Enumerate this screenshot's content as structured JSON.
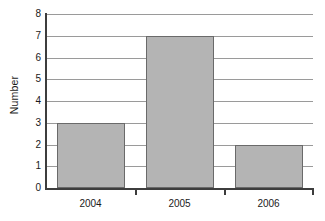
{
  "chart_data": {
    "type": "bar",
    "title": "",
    "subtitle": "",
    "xlabel": "",
    "ylabel": "Number",
    "categories": [
      "2004",
      "2005",
      "2006"
    ],
    "values": [
      3,
      7,
      2
    ],
    "series": [
      {
        "name": "Number",
        "values": [
          3,
          7,
          2
        ]
      }
    ],
    "ylim": [
      0,
      8
    ],
    "y_ticks": [
      0,
      1,
      2,
      3,
      4,
      5,
      6,
      7,
      8
    ],
    "y_tick_labels": [
      "0",
      "1",
      "2",
      "3",
      "4",
      "5",
      "6",
      "7",
      "8"
    ],
    "grid": true,
    "grid_axis": "y",
    "legend": false,
    "legend_position": "none",
    "annotations": [],
    "colors": {
      "bar_fill": "#b4b4b4",
      "bar_edge": "#6a6a6a",
      "gridline": "#9a9a9a",
      "axis": "#3d3d3d",
      "text": "#1a1a1a",
      "background": "#ffffff"
    }
  }
}
